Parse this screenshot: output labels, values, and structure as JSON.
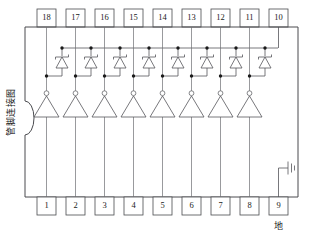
{
  "diagram": {
    "title_vertical": "管脚连接图",
    "ground_label": "地",
    "top_pins": [
      "18",
      "17",
      "16",
      "15",
      "14",
      "13",
      "12",
      "11",
      "10"
    ],
    "bottom_pins": [
      "1",
      "2",
      "3",
      "4",
      "5",
      "6",
      "7",
      "8",
      "9"
    ],
    "channel_count": 8,
    "symbols": {
      "buffer": "inverting-buffer-triangle",
      "diode": "zener-diode",
      "ground": "ground-symbol",
      "notch": "package-notch"
    },
    "colors": {
      "wire": "#55565a",
      "outline": "#4a4b4f",
      "node": "#1a1a1a",
      "text": "#1a1a1a",
      "background": "#ffffff"
    }
  }
}
